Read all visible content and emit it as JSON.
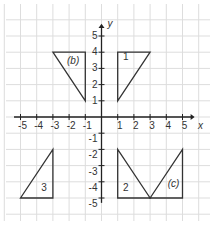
{
  "diagram": {
    "axes": {
      "x_label": "x",
      "y_label": "y",
      "x_ticks": [
        "-5",
        "-4",
        "-3",
        "-2",
        "-1",
        "1",
        "2",
        "3",
        "4",
        "5"
      ],
      "y_ticks": [
        "5",
        "4",
        "3",
        "2",
        "1",
        "-1",
        "-2",
        "-3",
        "-4",
        "-5"
      ],
      "range": [
        -5,
        5
      ]
    },
    "shapes": [
      {
        "label": "(b)",
        "vertices": [
          [
            -3,
            4
          ],
          [
            -1,
            4
          ],
          [
            -1,
            1
          ]
        ]
      },
      {
        "label": "1",
        "vertices": [
          [
            1,
            4
          ],
          [
            3,
            4
          ],
          [
            1,
            1
          ]
        ]
      },
      {
        "label": "3",
        "vertices": [
          [
            -5,
            -5
          ],
          [
            -3,
            -5
          ],
          [
            -3,
            -2
          ]
        ]
      },
      {
        "label": "2",
        "vertices": [
          [
            1,
            -2
          ],
          [
            1,
            -5
          ],
          [
            3,
            -5
          ]
        ]
      },
      {
        "label": "(c)",
        "vertices": [
          [
            3,
            -5
          ],
          [
            5,
            -5
          ],
          [
            5,
            -2
          ]
        ]
      }
    ],
    "colors": {
      "grid": "#dddddd",
      "axis": "#222222",
      "shape": "#333333"
    }
  }
}
